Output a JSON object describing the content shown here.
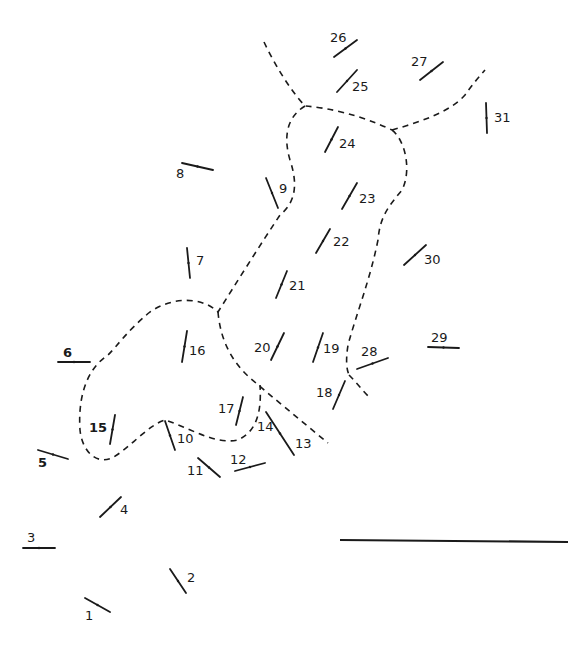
{
  "diagram": {
    "type": "station map with numbered strike/orientation marks and dashed boundary lines",
    "colors": {
      "ink": "#1a1a1a",
      "background": "#ffffff"
    },
    "stations": [
      {
        "id": "1",
        "label": "1",
        "x1": 85,
        "y1": 598,
        "x2": 110,
        "y2": 612,
        "lx": 85,
        "ly": 620
      },
      {
        "id": "2",
        "label": "2",
        "x1": 170,
        "y1": 569,
        "x2": 186,
        "y2": 593,
        "lx": 187,
        "ly": 582
      },
      {
        "id": "3",
        "label": "3",
        "x1": 23,
        "y1": 548,
        "x2": 55,
        "y2": 548,
        "lx": 27,
        "ly": 542
      },
      {
        "id": "4",
        "label": "4",
        "x1": 100,
        "y1": 517,
        "x2": 121,
        "y2": 497,
        "lx": 120,
        "ly": 514
      },
      {
        "id": "5",
        "label": "5",
        "x1": 38,
        "y1": 450,
        "x2": 68,
        "y2": 459,
        "lx": 38,
        "ly": 467,
        "bold": true
      },
      {
        "id": "6",
        "label": "6",
        "x1": 58,
        "y1": 362,
        "x2": 90,
        "y2": 362,
        "lx": 63,
        "ly": 357,
        "bold": true
      },
      {
        "id": "7",
        "label": "7",
        "x1": 187,
        "y1": 248,
        "x2": 190,
        "y2": 278,
        "lx": 196,
        "ly": 265
      },
      {
        "id": "8",
        "label": "8",
        "x1": 182,
        "y1": 163,
        "x2": 213,
        "y2": 170,
        "lx": 176,
        "ly": 178
      },
      {
        "id": "9",
        "label": "9",
        "x1": 266,
        "y1": 178,
        "x2": 278,
        "y2": 208,
        "lx": 279,
        "ly": 193
      },
      {
        "id": "10",
        "label": "10",
        "x1": 165,
        "y1": 421,
        "x2": 175,
        "y2": 450,
        "lx": 177,
        "ly": 443
      },
      {
        "id": "11",
        "label": "11",
        "x1": 198,
        "y1": 458,
        "x2": 220,
        "y2": 477,
        "lx": 187,
        "ly": 475
      },
      {
        "id": "12",
        "label": "12",
        "x1": 235,
        "y1": 471,
        "x2": 265,
        "y2": 463,
        "lx": 230,
        "ly": 464
      },
      {
        "id": "13",
        "label": "13",
        "x1": 266,
        "y1": 412,
        "x2": 294,
        "y2": 455,
        "lx": 295,
        "ly": 448
      },
      {
        "id": "14",
        "label": "14",
        "x1": 0,
        "y1": 0,
        "x2": 0,
        "y2": 0,
        "lx": 257,
        "ly": 431,
        "no_mark": true
      },
      {
        "id": "15",
        "label": "15",
        "x1": 110,
        "y1": 444,
        "x2": 115,
        "y2": 415,
        "lx": 89,
        "ly": 432,
        "bold": true
      },
      {
        "id": "16",
        "label": "16",
        "x1": 182,
        "y1": 362,
        "x2": 187,
        "y2": 331,
        "lx": 189,
        "ly": 355
      },
      {
        "id": "17",
        "label": "17",
        "x1": 236,
        "y1": 425,
        "x2": 243,
        "y2": 397,
        "lx": 218,
        "ly": 413
      },
      {
        "id": "18",
        "label": "18",
        "x1": 333,
        "y1": 409,
        "x2": 345,
        "y2": 381,
        "lx": 316,
        "ly": 397
      },
      {
        "id": "19",
        "label": "19",
        "x1": 313,
        "y1": 362,
        "x2": 323,
        "y2": 333,
        "lx": 323,
        "ly": 353
      },
      {
        "id": "20",
        "label": "20",
        "x1": 271,
        "y1": 360,
        "x2": 284,
        "y2": 333,
        "lx": 254,
        "ly": 352
      },
      {
        "id": "21",
        "label": "21",
        "x1": 276,
        "y1": 298,
        "x2": 287,
        "y2": 271,
        "lx": 289,
        "ly": 290
      },
      {
        "id": "22",
        "label": "22",
        "x1": 316,
        "y1": 253,
        "x2": 330,
        "y2": 229,
        "lx": 333,
        "ly": 246
      },
      {
        "id": "23",
        "label": "23",
        "x1": 342,
        "y1": 209,
        "x2": 357,
        "y2": 183,
        "lx": 359,
        "ly": 203
      },
      {
        "id": "24",
        "label": "24",
        "x1": 325,
        "y1": 152,
        "x2": 338,
        "y2": 127,
        "lx": 339,
        "ly": 148
      },
      {
        "id": "25",
        "label": "25",
        "x1": 337,
        "y1": 92,
        "x2": 357,
        "y2": 70,
        "lx": 352,
        "ly": 91
      },
      {
        "id": "26",
        "label": "26",
        "x1": 334,
        "y1": 57,
        "x2": 357,
        "y2": 40,
        "lx": 330,
        "ly": 42
      },
      {
        "id": "27",
        "label": "27",
        "x1": 420,
        "y1": 80,
        "x2": 443,
        "y2": 62,
        "lx": 411,
        "ly": 66
      },
      {
        "id": "28",
        "label": "28",
        "x1": 357,
        "y1": 369,
        "x2": 388,
        "y2": 358,
        "lx": 361,
        "ly": 356
      },
      {
        "id": "29",
        "label": "29",
        "x1": 428,
        "y1": 347,
        "x2": 459,
        "y2": 348,
        "lx": 431,
        "ly": 342
      },
      {
        "id": "30",
        "label": "30",
        "x1": 404,
        "y1": 265,
        "x2": 426,
        "y2": 245,
        "lx": 424,
        "ly": 264
      },
      {
        "id": "31",
        "label": "31",
        "x1": 486,
        "y1": 103,
        "x2": 487,
        "y2": 133,
        "lx": 494,
        "ly": 122
      }
    ],
    "boundaries": [
      {
        "id": "north-west-line",
        "d": "M 264 42 C 275 65, 290 90, 305 106 C 330 108, 360 115, 392 130"
      },
      {
        "id": "north-east-line",
        "d": "M 392 130 C 420 122, 450 112, 465 95 C 472 85, 478 78, 485 70"
      },
      {
        "id": "main-body",
        "d": "M 305 106 C 285 118, 284 140, 290 160 C 300 190, 292 205, 280 215 C 260 245, 235 285, 218 312 C 200 295, 170 298, 150 312 C 128 330, 118 345, 108 355 C 85 370, 78 400, 80 430 C 82 450, 95 465, 112 458 C 130 448, 148 425, 165 420 C 190 428, 215 445, 238 440 C 255 432, 262 415, 260 385"
      },
      {
        "id": "east-line",
        "d": "M 392 130 C 405 140, 412 170, 402 190 C 390 205, 380 215, 378 240 C 370 280, 356 315, 348 345 C 346 358, 346 368, 349 375"
      },
      {
        "id": "south-cross-a",
        "d": "M 218 312 C 220 335, 228 358, 250 378 C 270 395, 300 420, 328 443"
      },
      {
        "id": "south-cross-b",
        "d": "M 349 375 C 356 382, 362 390, 370 398"
      }
    ],
    "scale_bar": {
      "x1": 340,
      "y1": 540,
      "x2": 568,
      "y2": 542
    }
  }
}
